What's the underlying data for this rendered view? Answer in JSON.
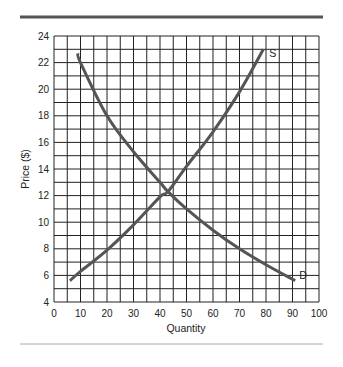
{
  "chart_data": {
    "type": "line",
    "title": "",
    "xlabel": "Quantity",
    "ylabel": "Price ($)",
    "xlim": [
      0,
      100
    ],
    "ylim": [
      4,
      24
    ],
    "xticks": [
      0,
      10,
      20,
      30,
      40,
      50,
      60,
      70,
      80,
      90,
      100
    ],
    "yticks": [
      4,
      6,
      8,
      10,
      12,
      14,
      16,
      18,
      20,
      22,
      24
    ],
    "grid": true,
    "grid_x_step": 5,
    "grid_y_step": 1,
    "series": [
      {
        "name": "S",
        "label": "S",
        "x": [
          6,
          10,
          20,
          30,
          40,
          43,
          50,
          60,
          70,
          79
        ],
        "y": [
          5.6,
          6.3,
          7.9,
          9.8,
          11.9,
          12.3,
          14.2,
          16.8,
          19.8,
          23.0
        ]
      },
      {
        "name": "D",
        "label": "D",
        "x": [
          9,
          10,
          20,
          30,
          40,
          43,
          50,
          60,
          70,
          80,
          91
        ],
        "y": [
          22.7,
          22.0,
          18.0,
          15.3,
          13.0,
          12.3,
          11.0,
          9.4,
          8.0,
          6.8,
          5.6
        ]
      }
    ],
    "equilibrium": {
      "x": 43,
      "y": 12.3
    }
  },
  "colors": {
    "curve": "#555555",
    "grid": "#222222",
    "rule_top": "#555555",
    "rule_bottom": "#aaaaaa"
  }
}
